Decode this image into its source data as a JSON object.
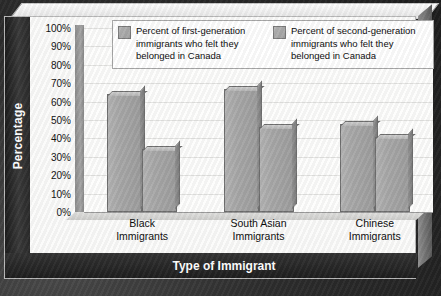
{
  "chart_data": {
    "type": "bar",
    "title": "",
    "xlabel": "Type of Immigrant",
    "ylabel": "Percentage",
    "categories": [
      "Black Immigrants",
      "South Asian Immigrants",
      "Chinese Immigrants"
    ],
    "series": [
      {
        "name": "Percent of first-generation immigrants who felt they belonged in Canada",
        "values": [
          64,
          67,
          48
        ]
      },
      {
        "name": "Percent of second-generation immigrants who felt they belonged in Canada",
        "values": [
          34,
          46,
          41
        ]
      }
    ],
    "ylim": [
      0,
      100
    ],
    "ytick_labels": [
      "100%",
      "90%",
      "80%",
      "70%",
      "60%",
      "50%",
      "40%",
      "30%",
      "20%",
      "10%",
      "0%"
    ],
    "ytick_values": [
      100,
      90,
      80,
      70,
      60,
      50,
      40,
      30,
      20,
      10,
      0
    ],
    "grid": true,
    "legend_position": "top",
    "bar_color": "#a8a8a8",
    "axis_band_color": "#2a2a2a",
    "plot_background": "#fdfdfc"
  },
  "axes": {
    "y_title": "Percentage",
    "x_title": "Type of Immigrant"
  },
  "legend": {
    "items": [
      {
        "line1": "Percent of first-generation",
        "line2": "immigrants who felt they",
        "line3": "belonged in Canada"
      },
      {
        "line1": "Percent of second-generation",
        "line2": "immigrants who felt they",
        "line3": "belonged in Canada"
      }
    ]
  },
  "categories": [
    {
      "line1": "Black",
      "line2": "Immigrants"
    },
    {
      "line1": "South Asian",
      "line2": "Immigrants"
    },
    {
      "line1": "Chinese",
      "line2": "Immigrants"
    }
  ]
}
